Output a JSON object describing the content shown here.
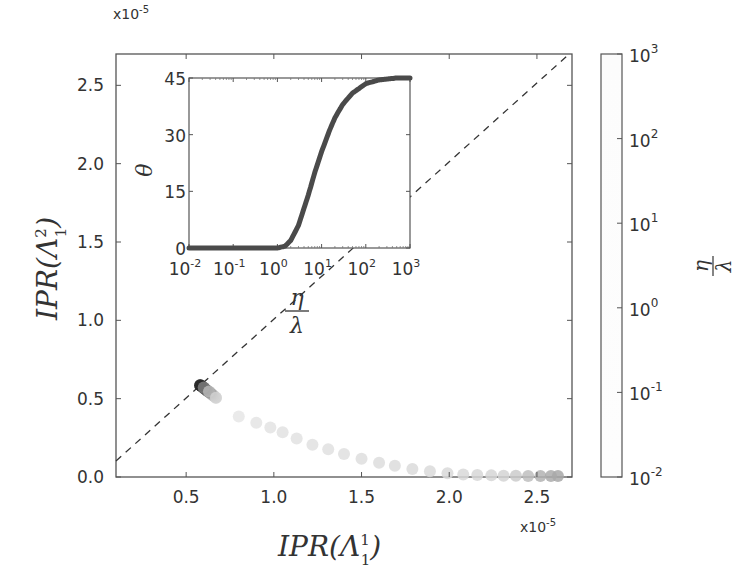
{
  "chart_data": [
    {
      "type": "scatter",
      "title": "",
      "xlabel": "IPR(Λ_1^1)",
      "ylabel": "IPR(Λ_1^2)",
      "x_multiplier": "x10-5",
      "y_multiplier": "x10-5",
      "xlim": [
        0.1,
        2.7
      ],
      "ylim": [
        0.0,
        2.7
      ],
      "xticks": [
        "0.5",
        "1.0",
        "1.5",
        "2.0",
        "2.5"
      ],
      "yticks": [
        "0.0",
        "0.5",
        "1.0",
        "1.5",
        "2.0",
        "2.5"
      ],
      "grid": false,
      "reference_line": {
        "style": "dashed",
        "description": "y = x diagonal",
        "color": "#333333"
      },
      "color_by": "eta/lambda (log scale, 1e-2 to 1e3)",
      "points": [
        {
          "x": 0.58,
          "y": 0.58,
          "eta_over_lambda": 0.01
        },
        {
          "x": 0.6,
          "y": 0.565,
          "eta_over_lambda": 0.1
        },
        {
          "x": 0.63,
          "y": 0.54,
          "eta_over_lambda": 0.5
        },
        {
          "x": 0.67,
          "y": 0.5,
          "eta_over_lambda": 1
        },
        {
          "x": 0.8,
          "y": 0.38,
          "eta_over_lambda": 2
        },
        {
          "x": 0.9,
          "y": 0.34,
          "eta_over_lambda": 3
        },
        {
          "x": 0.98,
          "y": 0.31,
          "eta_over_lambda": 4
        },
        {
          "x": 1.05,
          "y": 0.28,
          "eta_over_lambda": 5
        },
        {
          "x": 1.13,
          "y": 0.24,
          "eta_over_lambda": 6
        },
        {
          "x": 1.22,
          "y": 0.2,
          "eta_over_lambda": 8
        },
        {
          "x": 1.31,
          "y": 0.17,
          "eta_over_lambda": 10
        },
        {
          "x": 1.4,
          "y": 0.14,
          "eta_over_lambda": 13
        },
        {
          "x": 1.5,
          "y": 0.11,
          "eta_over_lambda": 17
        },
        {
          "x": 1.6,
          "y": 0.085,
          "eta_over_lambda": 22
        },
        {
          "x": 1.69,
          "y": 0.065,
          "eta_over_lambda": 30
        },
        {
          "x": 1.79,
          "y": 0.045,
          "eta_over_lambda": 40
        },
        {
          "x": 1.89,
          "y": 0.03,
          "eta_over_lambda": 55
        },
        {
          "x": 1.99,
          "y": 0.018,
          "eta_over_lambda": 75
        },
        {
          "x": 2.08,
          "y": 0.01,
          "eta_over_lambda": 100
        },
        {
          "x": 2.16,
          "y": 0.006,
          "eta_over_lambda": 140
        },
        {
          "x": 2.24,
          "y": 0.004,
          "eta_over_lambda": 200
        },
        {
          "x": 2.31,
          "y": 0.002,
          "eta_over_lambda": 280
        },
        {
          "x": 2.38,
          "y": 0.001,
          "eta_over_lambda": 400
        },
        {
          "x": 2.45,
          "y": 0.0,
          "eta_over_lambda": 560
        },
        {
          "x": 2.52,
          "y": 0.0,
          "eta_over_lambda": 750
        },
        {
          "x": 2.58,
          "y": 0.0,
          "eta_over_lambda": 900
        },
        {
          "x": 2.62,
          "y": 0.0,
          "eta_over_lambda": 1000
        }
      ]
    },
    {
      "type": "line",
      "title": "inset",
      "xlabel": "η/λ",
      "ylabel": "θ",
      "xscale": "log",
      "xlim": [
        0.01,
        1000
      ],
      "ylim": [
        0,
        45
      ],
      "xticks": [
        "10^-2",
        "10^-1",
        "10^0",
        "10^1",
        "10^2",
        "10^3"
      ],
      "yticks": [
        "0",
        "15",
        "30",
        "45"
      ],
      "grid": false,
      "series": [
        {
          "name": "θ vs η/λ",
          "color": "#444444",
          "x": [
            0.01,
            0.1,
            1,
            1.5,
            2,
            3,
            5,
            7,
            10,
            15,
            20,
            30,
            50,
            100,
            200,
            500,
            1000
          ],
          "y": [
            0,
            0,
            0,
            0.5,
            2,
            6,
            14,
            20,
            25.5,
            31,
            34.5,
            38,
            41,
            43.5,
            44.5,
            45,
            45
          ]
        }
      ]
    },
    {
      "type": "colorbar",
      "label": "η/λ",
      "scale": "log",
      "range": [
        0.01,
        1000
      ],
      "ticks": [
        "10^-2",
        "10^-1",
        "10^0",
        "10^1",
        "10^2",
        "10^3"
      ]
    }
  ],
  "main": {
    "y_multiplier": {
      "base": "x10",
      "exp": "-5"
    },
    "x_multiplier": {
      "base": "x10",
      "exp": "-5"
    },
    "xticks": [
      "0.5",
      "1.0",
      "1.5",
      "2.0",
      "2.5"
    ],
    "yticks": [
      "0.0",
      "0.5",
      "1.0",
      "1.5",
      "2.0",
      "2.5"
    ],
    "xlabel": {
      "main": "IPR(Λ",
      "sup": "1",
      "sub": "1",
      "close": ")"
    },
    "ylabel": {
      "main": "IPR(Λ",
      "sup": "2",
      "sub": "1",
      "close": ")"
    }
  },
  "inset": {
    "yticks": [
      "0",
      "15",
      "30",
      "45"
    ],
    "xticks": [
      {
        "base": "10",
        "exp": "-2"
      },
      {
        "base": "10",
        "exp": "-1"
      },
      {
        "base": "10",
        "exp": "0"
      },
      {
        "base": "10",
        "exp": "1"
      },
      {
        "base": "10",
        "exp": "2"
      },
      {
        "base": "10",
        "exp": "3"
      }
    ],
    "ylabel": "θ",
    "xlabel": {
      "num": "η",
      "den": "λ"
    }
  },
  "colorbar": {
    "ticks": [
      {
        "base": "10",
        "exp": "3"
      },
      {
        "base": "10",
        "exp": "2"
      },
      {
        "base": "10",
        "exp": "1"
      },
      {
        "base": "10",
        "exp": "0"
      },
      {
        "base": "10",
        "exp": "-1"
      },
      {
        "base": "10",
        "exp": "-2"
      }
    ],
    "label": {
      "num": "η",
      "den": "λ"
    }
  }
}
